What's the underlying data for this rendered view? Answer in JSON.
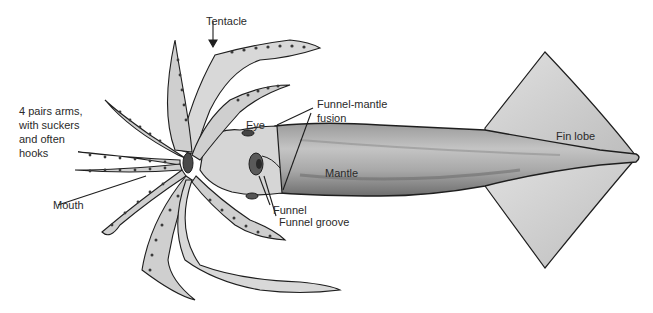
{
  "diagram": {
    "colors": {
      "outline": "#1e1e1e",
      "body_fill": "#b8b8b8",
      "body_dark": "#7a7a7a",
      "fin_fill": "#d4d4d4",
      "arm_fill": "#cfcfcf",
      "sucker": "#3a3a3a",
      "label_text": "#2a2a2a",
      "background": "#ffffff"
    },
    "labels": {
      "tentacle": "Tentacle",
      "arms": "4 pairs arms,\nwith suckers\nand often\nhooks",
      "mouth": "Mouth",
      "eye": "Eye",
      "funnel_mantle_fusion": "Funnel-mantle\nfusion",
      "mantle": "Mantle",
      "funnel": "Funnel",
      "funnel_groove": "Funnel groove",
      "fin_lobe": "Fin lobe"
    }
  }
}
